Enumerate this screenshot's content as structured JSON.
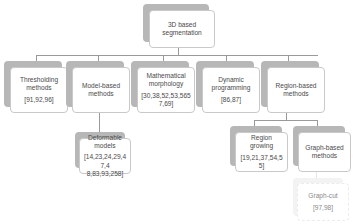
{
  "diagram": {
    "root": {
      "label": "3D based\nsegmentation"
    },
    "level1": [
      {
        "label": "Thresholding\nmethods",
        "refs": "[91,92,96]"
      },
      {
        "label": "Model-based\nmethods",
        "refs": ""
      },
      {
        "label": "Mathematical\nmorphology",
        "refs": "[30,38,52,53,565\n7,69]"
      },
      {
        "label": "Dynamic\nprogramming",
        "refs": "[86,87]"
      },
      {
        "label": "Region-based\nmethods",
        "refs": ""
      }
    ],
    "model_based_children": [
      {
        "label": "Deformable\nmodels",
        "refs": "[14,23,24,29,47,4\n8,83,93,258]"
      }
    ],
    "region_based_children": [
      {
        "label": "Region growing",
        "refs": "[19,21,37,54,55]"
      },
      {
        "label": "Graph-based\nmethods",
        "refs": ""
      }
    ],
    "graph_based_children": [
      {
        "label": "Graph-cut",
        "refs": "[97,98]"
      }
    ]
  }
}
